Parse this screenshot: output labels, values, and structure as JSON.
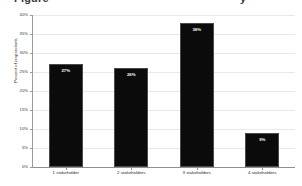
{
  "chart_data": {
    "type": "bar",
    "title": "",
    "xlabel": "",
    "ylabel": "Percent of respondents",
    "categories": [
      "1 stakeholder",
      "2 stakeholders",
      "3 stakeholders",
      "4 stakeholders"
    ],
    "values": [
      27,
      26,
      38,
      9
    ],
    "value_labels": [
      "27%",
      "26%",
      "38%",
      "9%"
    ],
    "ylim": [
      0,
      40
    ],
    "ytick_values": [
      0,
      5,
      10,
      15,
      20,
      25,
      30,
      35,
      40
    ],
    "ytick_labels": [
      "0%",
      "5%",
      "10%",
      "15%",
      "20%",
      "25%",
      "30%",
      "35%",
      "40%"
    ],
    "grid": true,
    "legend": "none",
    "bar_color": "#0b0b0b",
    "label_color": "#ffffff",
    "grid_color": "#e9e9e9",
    "axis_color": "#9a9a9a"
  },
  "figure": {
    "cropped_title_left": "Figure",
    "cropped_title_right": "y"
  }
}
